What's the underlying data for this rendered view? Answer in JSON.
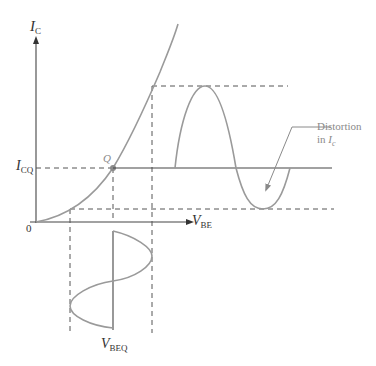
{
  "axes": {
    "y_label": "I",
    "y_label_sub": "C",
    "x_label": "V",
    "x_label_sub": "BE",
    "origin_label": "0"
  },
  "operating_point": {
    "label": "Q",
    "icq_label": "I",
    "icq_sub": "CQ",
    "vbeq_label": "V",
    "vbeq_sub": "BEQ"
  },
  "annotation": {
    "line1": "Distortion",
    "line2_prefix": "in ",
    "line2_var": "I",
    "line2_sub": "c"
  },
  "colors": {
    "curve": "#9a9a9a",
    "axis": "#444444",
    "dashed": "#555555",
    "q_point": "#8a8a8a"
  }
}
